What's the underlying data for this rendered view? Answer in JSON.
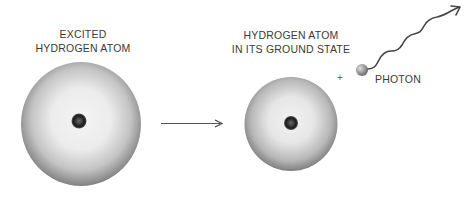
{
  "left": {
    "label_line1": "EXCITED",
    "label_line2": "HYDROGEN ATOM"
  },
  "right": {
    "label_line1": "HYDROGEN ATOM",
    "label_line2": "IN ITS GROUND STATE"
  },
  "operator": "+",
  "photon": {
    "label": "PHOTON"
  },
  "colors": {
    "text": "#3a3a3a",
    "cloud_center": "#f2f2f2",
    "cloud_edge": "#7a7a7a",
    "nucleus": "#1e1e1e",
    "arrow": "#444444"
  }
}
